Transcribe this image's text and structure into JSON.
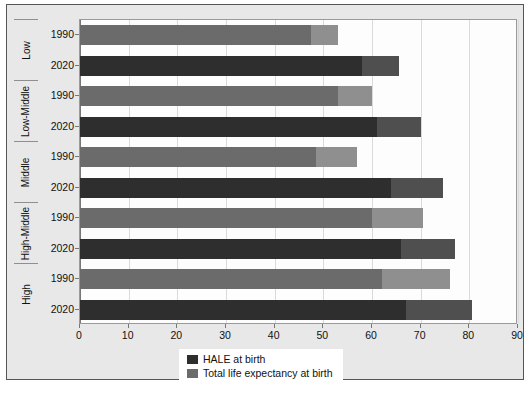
{
  "chart_data": {
    "type": "bar",
    "orientation": "horizontal",
    "stacked": true,
    "title": "",
    "xlabel": "",
    "ylabel": "",
    "xlim": [
      0,
      90
    ],
    "xticks": [
      0,
      10,
      20,
      30,
      40,
      50,
      60,
      70,
      80,
      90
    ],
    "grid": true,
    "legend_position": "bottom",
    "groups": [
      "Low",
      "Low-Middle",
      "Middle",
      "High-Middle",
      "High"
    ],
    "years": [
      "1990",
      "2020"
    ],
    "series": [
      {
        "name": "HALE at birth",
        "color": "#3a3a3a",
        "values": [
          47.5,
          58.0,
          53.0,
          61.0,
          48.5,
          64.0,
          60.0,
          66.0,
          62.0,
          67.0
        ]
      },
      {
        "name": "Total life expectancy at birth",
        "color": "#707070",
        "values": [
          53.0,
          65.5,
          60.0,
          70.0,
          57.0,
          74.5,
          70.5,
          77.0,
          76.0,
          80.5
        ]
      }
    ],
    "rows": [
      {
        "group": "Low",
        "year": "1990",
        "hale": 47.5,
        "total": 53.0
      },
      {
        "group": "Low",
        "year": "2020",
        "hale": 58.0,
        "total": 65.5
      },
      {
        "group": "Low-Middle",
        "year": "1990",
        "hale": 53.0,
        "total": 60.0
      },
      {
        "group": "Low-Middle",
        "year": "2020",
        "hale": 61.0,
        "total": 70.0
      },
      {
        "group": "Middle",
        "year": "1990",
        "hale": 48.5,
        "total": 57.0
      },
      {
        "group": "Middle",
        "year": "2020",
        "hale": 64.0,
        "total": 74.5
      },
      {
        "group": "High-Middle",
        "year": "1990",
        "hale": 60.0,
        "total": 70.5
      },
      {
        "group": "High-Middle",
        "year": "2020",
        "hale": 66.0,
        "total": 77.0
      },
      {
        "group": "High",
        "year": "1990",
        "hale": 62.0,
        "total": 76.0
      },
      {
        "group": "High",
        "year": "2020",
        "hale": 67.0,
        "total": 80.5
      }
    ],
    "style": {
      "hale_1990_color": "#6b6b6b",
      "total_1990_color": "#8f8f8f",
      "hale_2020_color": "#2e2e2e",
      "total_2020_color": "#4f4f4f",
      "plot_background": "#fdfdfd",
      "figure_background": "#e8e8e8",
      "gridline_color": "#dadada"
    }
  },
  "legend": {
    "items": [
      {
        "label": "HALE at birth",
        "color": "#2e2e2e"
      },
      {
        "label": "Total life expectancy at birth",
        "color": "#6b6b6b"
      }
    ]
  }
}
